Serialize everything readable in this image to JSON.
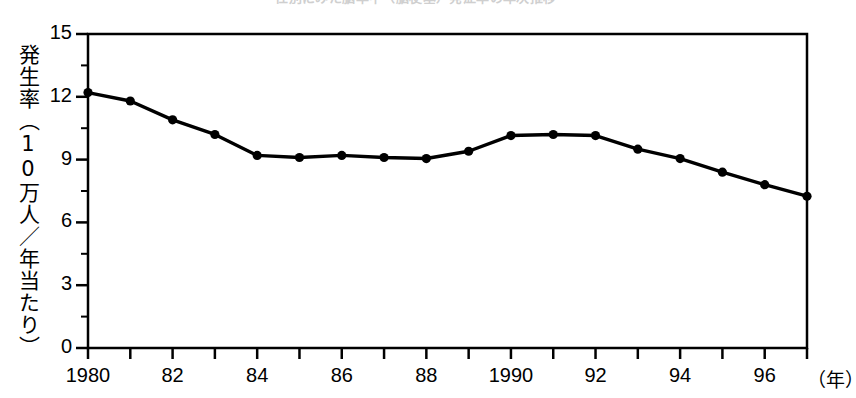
{
  "chart_title": "性別にみた脳卒中（脳梗塞）発症率の年次推移",
  "axes": {
    "y_title": "発生率（10万人／年当たり）",
    "y_ticks": [
      "0",
      "3",
      "6",
      "9",
      "12",
      "15"
    ],
    "x_unit_label": "（年）",
    "x_tick_labels": [
      "1980",
      "82",
      "84",
      "86",
      "88",
      "1990",
      "92",
      "94",
      "96"
    ]
  },
  "chart_data": {
    "type": "line",
    "title": "性別にみた脳卒中（脳梗塞）発症率の年次推移",
    "xlabel": "年",
    "ylabel": "発生率（10万人／年当たり）",
    "ylim": [
      0,
      15
    ],
    "xlim": [
      1980,
      1997
    ],
    "yticks": [
      0,
      3,
      6,
      9,
      12,
      15
    ],
    "xticks": [
      1980,
      1982,
      1984,
      1986,
      1988,
      1990,
      1992,
      1994,
      1996
    ],
    "xtick_labels": [
      "1980",
      "82",
      "84",
      "86",
      "88",
      "1990",
      "92",
      "94",
      "96"
    ],
    "grid": false,
    "legend": false,
    "marker": "filled-circle",
    "line_color": "#000000",
    "x": [
      1980,
      1981,
      1982,
      1983,
      1984,
      1985,
      1986,
      1987,
      1988,
      1989,
      1990,
      1991,
      1992,
      1993,
      1994,
      1995,
      1996,
      1997
    ],
    "values": [
      12.2,
      11.8,
      10.9,
      10.2,
      9.2,
      9.1,
      9.2,
      9.1,
      9.05,
      9.4,
      10.15,
      10.2,
      10.15,
      9.5,
      9.05,
      8.4,
      7.8,
      7.25
    ]
  }
}
